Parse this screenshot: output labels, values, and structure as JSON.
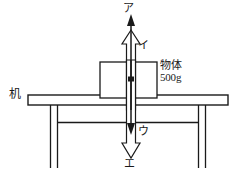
{
  "figure": {
    "width": 239,
    "height": 178,
    "background": "#ffffff",
    "ink_color": "#1a1a1a"
  },
  "labels": {
    "arrow_a": "ア",
    "arrow_i": "イ",
    "arrow_u": "ウ",
    "arrow_e": "エ",
    "desk": "机",
    "object_name": "物体",
    "object_mass": "500g"
  },
  "objects": {
    "block": {
      "label_line1": "物体",
      "label_line2": "500g",
      "x": 100,
      "y": 62,
      "width": 57,
      "height": 36
    },
    "desk": {
      "label": "机",
      "top_x": 28,
      "top_y": 95,
      "top_width": 200,
      "top_height": 10
    }
  },
  "vectors": [
    {
      "name": "ア",
      "direction": "up",
      "head": "solid",
      "length_px": 108,
      "description": "long upward solid arrow"
    },
    {
      "name": "イ",
      "direction": "up",
      "head": "hollow",
      "length_px": 60,
      "description": "upward hollow outlined arrow"
    },
    {
      "name": "ウ",
      "direction": "down",
      "head": "solid",
      "length_px": 108,
      "description": "long downward solid arrow"
    },
    {
      "name": "エ",
      "direction": "down",
      "head": "hollow",
      "length_px": 60,
      "description": "downward hollow outlined arrow"
    }
  ],
  "point_of_application": {
    "x": 131,
    "y": 79,
    "shape": "dot"
  }
}
